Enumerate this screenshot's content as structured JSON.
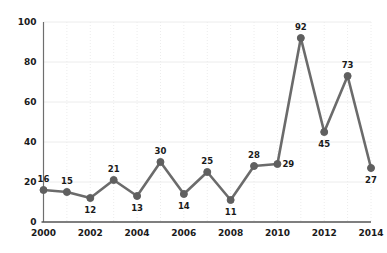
{
  "chart_data": {
    "type": "line",
    "title": "",
    "subtitle": "",
    "xlabel": "",
    "ylabel": "",
    "x": [
      2000,
      2001,
      2002,
      2003,
      2004,
      2005,
      2006,
      2007,
      2008,
      2009,
      2010,
      2011,
      2012,
      2013,
      2014
    ],
    "categories": [
      "2000",
      "2001",
      "2002",
      "2003",
      "2004",
      "2005",
      "2006",
      "2007",
      "2008",
      "2009",
      "2010",
      "2011",
      "2012",
      "2013",
      "2014"
    ],
    "values": [
      16,
      15,
      12,
      21,
      13,
      30,
      14,
      25,
      11,
      28,
      29,
      92,
      45,
      73,
      27
    ],
    "series": [
      {
        "name": "",
        "values": [
          16,
          15,
          12,
          21,
          13,
          30,
          14,
          25,
          11,
          28,
          29,
          92,
          45,
          73,
          27
        ]
      }
    ],
    "data_labels": [
      "16",
      "15",
      "12",
      "21",
      "13",
      "30",
      "14",
      "25",
      "11",
      "28",
      "29",
      "92",
      "45",
      "73",
      "27"
    ],
    "data_label_positions": [
      "above",
      "above",
      "below",
      "above",
      "below",
      "above",
      "below",
      "above",
      "below",
      "above",
      "right",
      "above",
      "below",
      "above",
      "below"
    ],
    "xlim": [
      2000,
      2014
    ],
    "ylim": [
      0,
      100
    ],
    "yticks": [
      0,
      20,
      40,
      60,
      80,
      100
    ],
    "ytick_labels": [
      "0",
      "20",
      "40",
      "60",
      "80",
      "100"
    ],
    "xticks": [
      2000,
      2002,
      2004,
      2006,
      2008,
      2010,
      2012,
      2014
    ],
    "xtick_labels": [
      "2000",
      "2002",
      "2004",
      "2006",
      "2008",
      "2010",
      "2012",
      "2014"
    ],
    "grid": true,
    "grid_style": "dotted",
    "legend": false,
    "legend_position": "none",
    "marker": "circle",
    "colors": {
      "line": "#6b6b6b",
      "marker": "#5f5f5f",
      "grid": "#ececec",
      "axis": "#6e6e6e",
      "text": "#1a1a1a",
      "background": "#ffffff"
    }
  }
}
